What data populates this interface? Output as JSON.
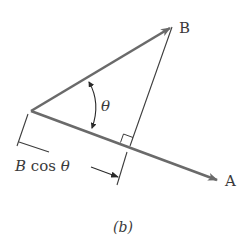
{
  "figure": {
    "caption": "(b)"
  },
  "labels": {
    "vector_b": "B",
    "vector_a": "A",
    "angle": "θ",
    "projection": "B cos θ"
  },
  "colors": {
    "vector": "#6a6a6a",
    "line": "#3c3c3c",
    "text": "#3a3a3a",
    "background": "#ffffff"
  }
}
